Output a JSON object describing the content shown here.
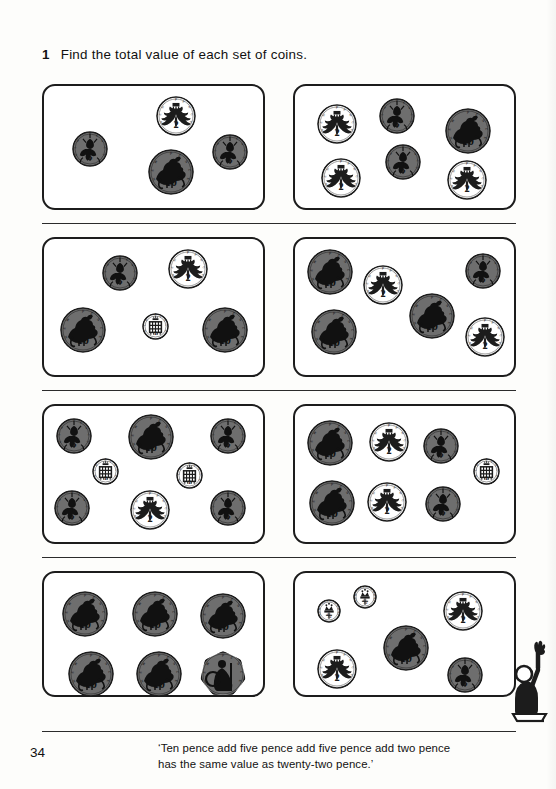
{
  "page": {
    "number": "34",
    "background": "#fdfdfb",
    "ink": "#1c1c1c"
  },
  "question": {
    "number": "1",
    "text": "Find the total value of each set of coins."
  },
  "footer": {
    "quote_line1": "‘Ten pence add five pence add five pence add two pence",
    "quote_line2": "has the same value as twenty-two pence.’"
  },
  "figure": {
    "label": "child-raising-hand"
  },
  "coin_styles": {
    "p1": {
      "value": "1",
      "face": "#ffffff",
      "outline": "#1c1c1c",
      "diameter": 27,
      "design": "portcullis",
      "legend": "NEW PENCE"
    },
    "hp": {
      "value": "½",
      "face": "#ffffff",
      "outline": "#1c1c1c",
      "diameter": 24,
      "design": "crown",
      "legend": "NEW HALF PENNY"
    },
    "p2": {
      "value": "2",
      "face": "#ffffff",
      "outline": "#1c1c1c",
      "diameter": 40,
      "design": "feathers",
      "legend": "NEW PENCE"
    },
    "p5": {
      "value": "5",
      "face": "#6e6e6e",
      "outline": "#1c1c1c",
      "diameter": 36,
      "design": "thistle",
      "legend": "NEW PENCE"
    },
    "p10": {
      "value": "10",
      "face": "#6e6e6e",
      "outline": "#1c1c1c",
      "diameter": 46,
      "design": "lion",
      "legend": "NEW PENCE"
    },
    "p50": {
      "value": "50",
      "face": "#6e6e6e",
      "outline": "#1c1c1c",
      "diameter": 46,
      "design": "britannia",
      "legend": "NEW PENCE"
    }
  },
  "boxes": [
    {
      "id": "set-1",
      "total_pence": 22,
      "coins": [
        {
          "type": "p5",
          "x": 28,
          "y": 45
        },
        {
          "type": "p2",
          "x": 112,
          "y": 10
        },
        {
          "type": "p10",
          "x": 104,
          "y": 63
        },
        {
          "type": "p5",
          "x": 168,
          "y": 48
        }
      ]
    },
    {
      "id": "set-2",
      "total_pence": 26,
      "coins": [
        {
          "type": "p2",
          "x": 22,
          "y": 18
        },
        {
          "type": "p5",
          "x": 84,
          "y": 12
        },
        {
          "type": "p10",
          "x": 150,
          "y": 22
        },
        {
          "type": "p5",
          "x": 90,
          "y": 58
        },
        {
          "type": "p2",
          "x": 26,
          "y": 72
        },
        {
          "type": "p2",
          "x": 152,
          "y": 74
        }
      ]
    },
    {
      "id": "set-3",
      "total_pence": 28,
      "coins": [
        {
          "type": "p5",
          "x": 58,
          "y": 16
        },
        {
          "type": "p2",
          "x": 124,
          "y": 10
        },
        {
          "type": "p10",
          "x": 16,
          "y": 68
        },
        {
          "type": "p1",
          "x": 98,
          "y": 74
        },
        {
          "type": "p10",
          "x": 158,
          "y": 68
        }
      ]
    },
    {
      "id": "set-4",
      "total_pence": 39,
      "coins": [
        {
          "type": "p10",
          "x": 12,
          "y": 10
        },
        {
          "type": "p2",
          "x": 68,
          "y": 26
        },
        {
          "type": "p5",
          "x": 170,
          "y": 14
        },
        {
          "type": "p10",
          "x": 16,
          "y": 70
        },
        {
          "type": "p10",
          "x": 114,
          "y": 54
        },
        {
          "type": "p2",
          "x": 170,
          "y": 78
        }
      ]
    },
    {
      "id": "set-5",
      "total_pence": 34,
      "coins": [
        {
          "type": "p5",
          "x": 12,
          "y": 12
        },
        {
          "type": "p10",
          "x": 84,
          "y": 8
        },
        {
          "type": "p5",
          "x": 166,
          "y": 12
        },
        {
          "type": "p1",
          "x": 48,
          "y": 52
        },
        {
          "type": "p1",
          "x": 132,
          "y": 56
        },
        {
          "type": "p5",
          "x": 10,
          "y": 84
        },
        {
          "type": "p2",
          "x": 86,
          "y": 84
        },
        {
          "type": "p5",
          "x": 166,
          "y": 84
        }
      ]
    },
    {
      "id": "set-6",
      "total_pence": 35,
      "coins": [
        {
          "type": "p10",
          "x": 12,
          "y": 14
        },
        {
          "type": "p2",
          "x": 74,
          "y": 16
        },
        {
          "type": "p5",
          "x": 128,
          "y": 22
        },
        {
          "type": "p1",
          "x": 178,
          "y": 52
        },
        {
          "type": "p10",
          "x": 14,
          "y": 74
        },
        {
          "type": "p2",
          "x": 72,
          "y": 76
        },
        {
          "type": "p5",
          "x": 130,
          "y": 80
        }
      ]
    },
    {
      "id": "set-7",
      "total_pence": 100,
      "coins": [
        {
          "type": "p10",
          "x": 18,
          "y": 18
        },
        {
          "type": "p10",
          "x": 88,
          "y": 18
        },
        {
          "type": "p10",
          "x": 156,
          "y": 20
        },
        {
          "type": "p10",
          "x": 24,
          "y": 78
        },
        {
          "type": "p10",
          "x": 92,
          "y": 78
        },
        {
          "type": "p50",
          "x": 156,
          "y": 78
        }
      ]
    },
    {
      "id": "set-8",
      "total_pence": 30,
      "coins": [
        {
          "type": "hp",
          "x": 22,
          "y": 26
        },
        {
          "type": "hp",
          "x": 58,
          "y": 12
        },
        {
          "type": "p2",
          "x": 148,
          "y": 18
        },
        {
          "type": "p10",
          "x": 88,
          "y": 52
        },
        {
          "type": "p2",
          "x": 22,
          "y": 76
        },
        {
          "type": "p5",
          "x": 152,
          "y": 84
        }
      ]
    }
  ]
}
